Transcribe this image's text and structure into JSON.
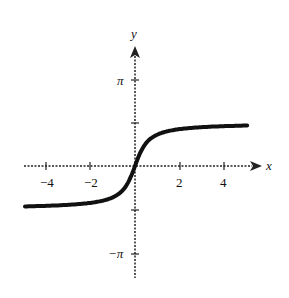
{
  "chart_data": {
    "type": "line",
    "title": "",
    "xlabel": "x",
    "ylabel": "y",
    "xlim": [
      -5,
      5.5
    ],
    "ylim": [
      -3.9,
      4.2
    ],
    "x_ticks": [
      -4,
      -2,
      2,
      4
    ],
    "x_tick_labels": [
      "−4",
      "−2",
      "2",
      "4"
    ],
    "y_ticks": [
      3.1416,
      1.5708,
      -1.5708,
      -3.1416
    ],
    "y_tick_labels": [
      "π",
      "",
      "",
      "−π"
    ],
    "grid": false,
    "series": [
      {
        "name": "y = arctan-type curve",
        "x": [
          -5,
          -4,
          -3,
          -2,
          -1,
          -0.5,
          0,
          0.5,
          1,
          2,
          3,
          4,
          5
        ],
        "y": [
          -1.47,
          -1.45,
          -1.41,
          -1.33,
          -1.11,
          -0.79,
          0,
          0.79,
          1.11,
          1.33,
          1.41,
          1.45,
          1.47
        ]
      }
    ],
    "asymptotes_note": "curve approaches y = ±π/2"
  }
}
